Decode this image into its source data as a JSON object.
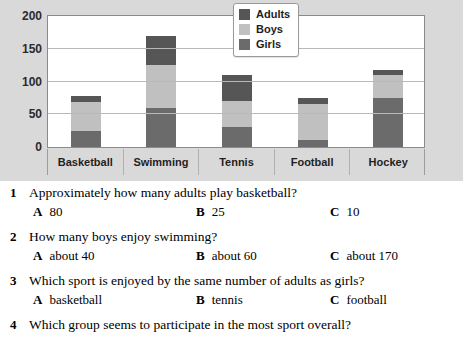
{
  "chart_data": {
    "type": "bar",
    "subtype": "stacked-bar",
    "title": "",
    "xlabel": "",
    "ylabel": "",
    "categories": [
      "Basketball",
      "Swimming",
      "Tennis",
      "Football",
      "Hockey"
    ],
    "series": [
      {
        "name": "Girls",
        "color": "#6b6b6b",
        "values": [
          25,
          60,
          30,
          10,
          75
        ]
      },
      {
        "name": "Boys",
        "color": "#c0c0c0",
        "values": [
          43,
          65,
          40,
          55,
          35
        ]
      },
      {
        "name": "Adults",
        "color": "#565656",
        "values": [
          10,
          45,
          40,
          10,
          7
        ]
      }
    ],
    "stack_totals": [
      78,
      170,
      110,
      75,
      117
    ],
    "yticks": [
      0,
      50,
      100,
      150,
      200
    ],
    "ylim": [
      0,
      200
    ],
    "grid": true,
    "legend_position": "top-right",
    "legend_order": [
      "Adults",
      "Boys",
      "Girls"
    ]
  },
  "legend": {
    "entries": [
      {
        "label": "Adults",
        "color": "#565656"
      },
      {
        "label": "Boys",
        "color": "#c0c0c0"
      },
      {
        "label": "Girls",
        "color": "#6b6b6b"
      }
    ]
  },
  "axis": {
    "y_tick_labels": [
      "200",
      "150",
      "100",
      "50",
      "0"
    ]
  },
  "questions": [
    {
      "number": "1",
      "text": "Approximately how many adults play basketball?",
      "options": [
        {
          "letter": "A",
          "text": "80"
        },
        {
          "letter": "B",
          "text": "25"
        },
        {
          "letter": "C",
          "text": "10"
        }
      ]
    },
    {
      "number": "2",
      "text": "How many boys enjoy swimming?",
      "options": [
        {
          "letter": "A",
          "text": "about 40"
        },
        {
          "letter": "B",
          "text": "about 60"
        },
        {
          "letter": "C",
          "text": "about 170"
        }
      ]
    },
    {
      "number": "3",
      "text": "Which sport is enjoyed by the same number of adults as girls?",
      "options": [
        {
          "letter": "A",
          "text": "basketball"
        },
        {
          "letter": "B",
          "text": "tennis"
        },
        {
          "letter": "C",
          "text": "football"
        }
      ]
    },
    {
      "number": "4",
      "text": "Which group seems to participate in the most sport overall?",
      "options": []
    }
  ]
}
